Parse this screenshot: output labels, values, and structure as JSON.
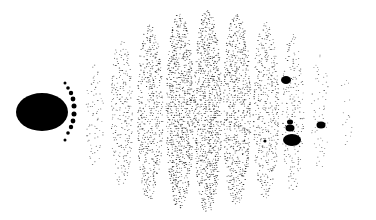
{
  "figure": {
    "background": "#ffffff",
    "ink": "#000000",
    "large_ellipse": {
      "cx": 42,
      "cy": 112,
      "rx": 26,
      "ry": 19
    },
    "bead_arc": [
      {
        "cx": 65,
        "cy": 83,
        "r": 1.5
      },
      {
        "cx": 68,
        "cy": 88,
        "r": 1.8
      },
      {
        "cx": 71,
        "cy": 93,
        "r": 2.2
      },
      {
        "cx": 73,
        "cy": 99,
        "r": 2.4
      },
      {
        "cx": 74,
        "cy": 106,
        "r": 2.5
      },
      {
        "cx": 74,
        "cy": 114,
        "r": 2.5
      },
      {
        "cx": 73,
        "cy": 121,
        "r": 2.4
      },
      {
        "cx": 71,
        "cy": 127,
        "r": 2.2
      },
      {
        "cx": 68,
        "cy": 133,
        "r": 1.8
      },
      {
        "cx": 65,
        "cy": 140,
        "r": 1.5
      }
    ],
    "blobs": [
      {
        "cx": 286,
        "cy": 80,
        "rx": 5,
        "ry": 4
      },
      {
        "cx": 290,
        "cy": 122,
        "rx": 3,
        "ry": 2.5
      },
      {
        "cx": 290,
        "cy": 128,
        "rx": 4.5,
        "ry": 3.5
      },
      {
        "cx": 292,
        "cy": 140,
        "rx": 9,
        "ry": 6
      },
      {
        "cx": 321,
        "cy": 125,
        "rx": 4.5,
        "ry": 3.5
      },
      {
        "cx": 265,
        "cy": 141,
        "rx": 1.5,
        "ry": 1.5
      }
    ],
    "dot_columns": [
      {
        "cx": 95,
        "top": 65,
        "bottom": 165,
        "halfwidth": 8,
        "density": 0.35
      },
      {
        "cx": 122,
        "top": 40,
        "bottom": 185,
        "halfwidth": 10,
        "density": 0.6
      },
      {
        "cx": 150,
        "top": 25,
        "bottom": 200,
        "halfwidth": 12,
        "density": 0.8
      },
      {
        "cx": 180,
        "top": 14,
        "bottom": 208,
        "halfwidth": 13,
        "density": 1.0
      },
      {
        "cx": 208,
        "top": 10,
        "bottom": 212,
        "halfwidth": 13,
        "density": 1.0
      },
      {
        "cx": 237,
        "top": 14,
        "bottom": 205,
        "halfwidth": 13,
        "density": 0.9
      },
      {
        "cx": 266,
        "top": 22,
        "bottom": 198,
        "halfwidth": 12,
        "density": 0.7
      },
      {
        "cx": 293,
        "top": 35,
        "bottom": 190,
        "halfwidth": 10,
        "density": 0.5
      },
      {
        "cx": 320,
        "top": 55,
        "bottom": 170,
        "halfwidth": 8,
        "density": 0.3
      },
      {
        "cx": 346,
        "top": 80,
        "bottom": 145,
        "halfwidth": 6,
        "density": 0.15
      }
    ]
  }
}
